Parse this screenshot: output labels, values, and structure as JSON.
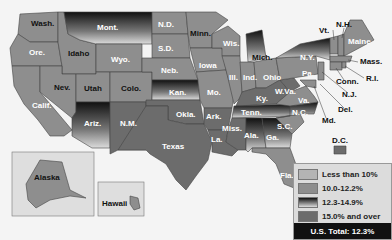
{
  "map": {
    "categories": [
      {
        "label": "Less than 10%",
        "color": "#b4b4b4"
      },
      {
        "label": "10.0-12.2%",
        "color": "#8e8e8e"
      },
      {
        "label": "12.3-14.9%",
        "color": "gradient"
      },
      {
        "label": "15.0% and over",
        "color": "#6c6c6c"
      }
    ],
    "total": "U.S. Total: 12.3%",
    "states": {
      "wash": "Wash.",
      "ore": "Ore.",
      "calif": "Calif.",
      "idaho": "Idaho",
      "nev": "Nev.",
      "mont": "Mont.",
      "wyo": "Wyo.",
      "utah": "Utah",
      "colo": "Colo.",
      "ariz": "Ariz.",
      "nm": "N.M.",
      "nd": "N.D.",
      "sd": "S.D.",
      "neb": "Neb.",
      "kan": "Kan.",
      "okla": "Okla.",
      "texas": "Texas",
      "minn": "Minn.",
      "iowa": "Iowa",
      "mo": "Mo.",
      "ark": "Ark.",
      "la": "La.",
      "wis": "Wis.",
      "ill": "Ill.",
      "mich": "Mich.",
      "ind": "Ind.",
      "ohio": "Ohio",
      "ky": "Ky.",
      "tenn": "Tenn.",
      "miss": "Miss.",
      "ala": "Ala.",
      "ga": "Ga.",
      "fla": "Fla.",
      "sc": "S.C.",
      "nc": "N.C.",
      "va": "Va.",
      "wva": "W.Va.",
      "pa": "Pa.",
      "ny": "N.Y.",
      "vt": "Vt.",
      "nh": "N.H.",
      "maine": "Maine",
      "mass": "Mass.",
      "ri": "R.I.",
      "conn": "Conn.",
      "nj": "N.J.",
      "del": "Del.",
      "md": "Md.",
      "dc": "D.C.",
      "alaska": "Alaska",
      "hawaii": "Hawaii"
    }
  }
}
